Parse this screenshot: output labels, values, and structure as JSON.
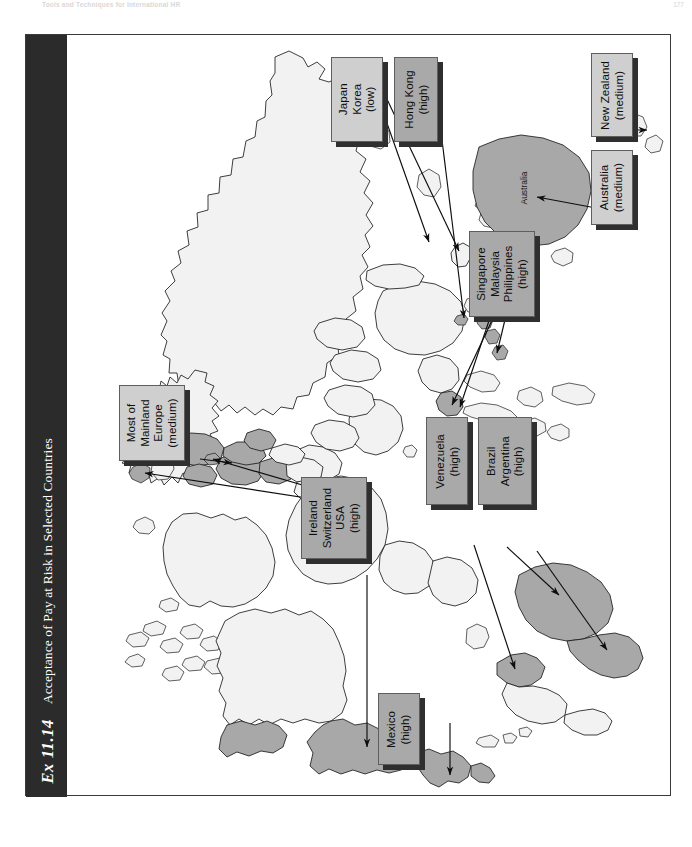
{
  "running_head": {
    "title": "Tools and Techniques for International HR",
    "page_number": "177"
  },
  "exhibit": {
    "number": "Ex 11.14",
    "title": "Acceptance of Pay at Risk in Selected Countries"
  },
  "map": {
    "inline_labels": [
      {
        "name": "Australia",
        "text": "Australia"
      }
    ],
    "legend_note": "Shaded countries indicate level of acceptance"
  },
  "callouts": [
    {
      "id": "japan-korea",
      "lines": [
        "Japan",
        "Korea",
        "(low)"
      ],
      "level": "low",
      "shade": "light"
    },
    {
      "id": "hong-kong",
      "lines": [
        "Hong Kong",
        "(high)"
      ],
      "level": "high",
      "shade": "dark"
    },
    {
      "id": "new-zealand",
      "lines": [
        "New Zealand",
        "(medium)"
      ],
      "level": "medium",
      "shade": "light"
    },
    {
      "id": "australia",
      "lines": [
        "Australia",
        "(medium)"
      ],
      "level": "medium",
      "shade": "light"
    },
    {
      "id": "singapore-malaysia-philippines",
      "lines": [
        "Singapore",
        "Malaysia",
        "Philippines",
        "(high)"
      ],
      "level": "high",
      "shade": "dark"
    },
    {
      "id": "mainland-europe",
      "lines": [
        "Most of",
        "Mainland",
        "Europe",
        "(medium)"
      ],
      "level": "medium",
      "shade": "light"
    },
    {
      "id": "ireland-switzerland-usa",
      "lines": [
        "Ireland",
        "Switzerland",
        "USA",
        "(high)"
      ],
      "level": "high",
      "shade": "dark"
    },
    {
      "id": "venezuela",
      "lines": [
        "Venezuela",
        "(high)"
      ],
      "level": "high",
      "shade": "dark"
    },
    {
      "id": "brazil-argentina",
      "lines": [
        "Brazil",
        "Argentina",
        "(high)"
      ],
      "level": "high",
      "shade": "dark"
    },
    {
      "id": "mexico",
      "lines": [
        "Mexico",
        "(high)"
      ],
      "level": "high",
      "shade": "dark"
    }
  ],
  "colors": {
    "title_bar": "#2b2b2b",
    "callout_light": "#cfcfcf",
    "callout_dark": "#a9a9a9",
    "callout_shadow": "#2f2f2f",
    "country_unshaded": "#f2f2f2",
    "country_shaded": "#a8a8a8",
    "frame_border": "#3a3a3a",
    "page_background": "#ffffff"
  }
}
